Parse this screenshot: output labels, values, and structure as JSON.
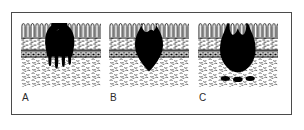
{
  "figure": {
    "type": "medical-histology-diagram",
    "title": "",
    "frame_color": "#4b4b4b",
    "background": "#ffffff",
    "ink_color": "#000000"
  },
  "layers": [
    {
      "id": "epithelium",
      "name": "epithelium",
      "pattern": "palisade-loops"
    },
    {
      "id": "lamina-propria",
      "name": "lamina propria",
      "pattern": "fine-dashes"
    },
    {
      "id": "muscularis-mucosae",
      "name": "muscularis mucosae",
      "pattern": "brick-band"
    },
    {
      "id": "submucosa",
      "name": "submucosa",
      "pattern": "loose-stroma"
    }
  ],
  "panels": [
    {
      "id": "a",
      "label": "A",
      "lesion": "broad-based mass with finger-like downward projections",
      "invasion_depth": "through muscularis mucosae into submucosa",
      "emboli_count": 0
    },
    {
      "id": "b",
      "label": "B",
      "lesion": "compact mass with pointed base",
      "invasion_depth": "through muscularis mucosae into submucosa",
      "emboli_count": 0
    },
    {
      "id": "c",
      "label": "C",
      "lesion": "large rounded mass with cleft at surface",
      "invasion_depth": "deep into submucosa",
      "emboli_count": 3
    }
  ]
}
